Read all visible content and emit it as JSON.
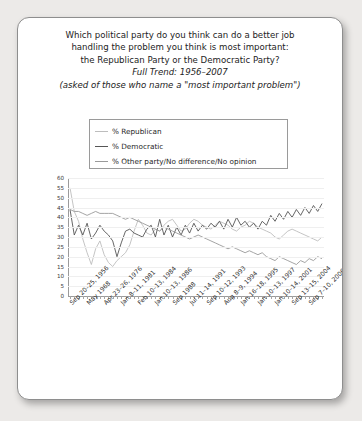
{
  "card": {
    "title_lines": [
      "Which political party do you think can do a better job",
      "handling the problem you think is most important:",
      "the Republican Party or the Democratic Party?"
    ],
    "subtitle": "Full Trend: 1956–2007",
    "note": "(asked of those who name a \"most important problem\")"
  },
  "chart_data": {
    "type": "line",
    "title": "Which political party do you think can do a better job handling the problem you think is most important: the Republican Party or the Democratic Party?",
    "subtitle": "Full Trend: 1956–2007",
    "annotation": "(asked of those who name a \"most important problem\")",
    "xlabel": "",
    "ylabel": "",
    "ylim": [
      0,
      60
    ],
    "yticks": [
      0,
      5,
      10,
      15,
      20,
      25,
      30,
      35,
      40,
      45,
      50,
      55,
      60
    ],
    "grid": true,
    "legend_position": "top",
    "legend": [
      "% Republican",
      "% Democratic",
      "% Other party/No difference/No opinion"
    ],
    "colors": {
      "republican": "#bdbdbd",
      "democratic": "#565656",
      "other": "#9a9a9a"
    },
    "xtick_labels": [
      "Sep 20–25, 1956",
      "May 1968",
      "Apr 23–26, 1976",
      "Jan 8–11, 1981",
      "Feb 10–13, 1984",
      "Jan 10–13, 1986",
      "Sep 1988",
      "Jul 11–14, 1991",
      "Sep 10–12, 1993",
      "Aug 8–9, 1994",
      "Jan 16–18, 1995",
      "Jan 10–13, 1997",
      "Jan 10–14, 2001",
      "Sep 13–15, 2004",
      "Sep 7–10, 2006"
    ],
    "xtick_indices": [
      0,
      4,
      8,
      12,
      16,
      20,
      24,
      28,
      32,
      36,
      40,
      44,
      48,
      52,
      56
    ],
    "n_points": 60,
    "series": [
      {
        "name": "% Republican",
        "color": "#bdbdbd",
        "values": [
          55,
          43,
          38,
          29,
          22,
          16,
          24,
          28,
          21,
          17,
          15,
          18,
          20,
          22,
          26,
          33,
          39,
          36,
          32,
          31,
          34,
          33,
          36,
          38,
          39,
          36,
          33,
          34,
          37,
          39,
          38,
          36,
          35,
          34,
          36,
          38,
          37,
          36,
          34,
          33,
          35,
          36,
          38,
          37,
          35,
          34,
          33,
          32,
          30,
          29,
          31,
          33,
          34,
          33,
          32,
          31,
          30,
          29,
          28,
          30
        ]
      },
      {
        "name": "% Democratic",
        "color": "#565656",
        "values": [
          44,
          31,
          36,
          31,
          37,
          29,
          32,
          36,
          33,
          31,
          28,
          20,
          27,
          33,
          34,
          32,
          31,
          30,
          34,
          36,
          30,
          39,
          31,
          36,
          30,
          35,
          31,
          36,
          32,
          37,
          33,
          36,
          34,
          37,
          35,
          38,
          34,
          39,
          35,
          40,
          36,
          38,
          35,
          37,
          34,
          38,
          36,
          41,
          38,
          42,
          39,
          43,
          40,
          44,
          41,
          45,
          42,
          46,
          43,
          47
        ]
      },
      {
        "name": "% Other party/No difference/No opinion",
        "color": "#9a9a9a",
        "values": [
          44,
          43,
          43,
          42,
          41,
          42,
          43,
          42,
          42,
          42,
          42,
          41,
          40,
          39,
          40,
          39,
          38,
          37,
          36,
          35,
          34,
          33,
          35,
          34,
          33,
          32,
          31,
          30,
          29,
          30,
          31,
          30,
          29,
          28,
          27,
          26,
          25,
          24,
          25,
          24,
          23,
          22,
          23,
          22,
          21,
          22,
          20,
          19,
          18,
          20,
          19,
          18,
          17,
          16,
          18,
          17,
          19,
          18,
          20,
          19
        ]
      }
    ]
  }
}
